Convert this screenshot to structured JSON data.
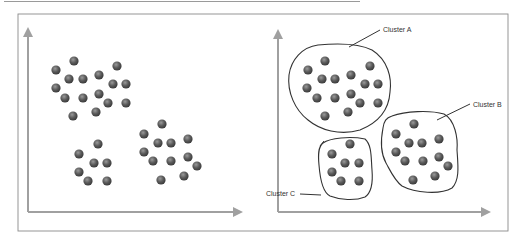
{
  "figure": {
    "colors": {
      "background": "#ffffff",
      "frame": "#8a8a8a",
      "top_rule": "#9a9a9a",
      "axis": "#a0a0a0",
      "dot": "#5a5a5a",
      "dot_highlight": "#9a9a9a",
      "dot_shadow": "#3a3a3a",
      "outline": "#333333",
      "label": "#333333"
    },
    "frame": {
      "x": 18,
      "y": 14,
      "w": 490,
      "h": 217
    },
    "top_rule": {
      "x1": 4,
      "x2": 360,
      "y": 1.5
    }
  },
  "panels": [
    {
      "id": "unclustered",
      "axes": {
        "origin": [
          28,
          212
        ],
        "y_tip": 28,
        "x_tip": 242
      },
      "groups": [
        {
          "points": [
            [
              74,
              61
            ],
            [
              56,
              70
            ],
            [
              69,
              79
            ],
            [
              83,
              79
            ],
            [
              99,
              75
            ],
            [
              117,
              66
            ],
            [
              113,
              84
            ],
            [
              126,
              84
            ],
            [
              56,
              88
            ],
            [
              65,
              98
            ],
            [
              83,
              98
            ],
            [
              99,
              94
            ],
            [
              108,
              103
            ],
            [
              126,
              103
            ],
            [
              73,
              116
            ],
            [
              96,
              112
            ]
          ]
        },
        {
          "points": [
            [
              98,
              144
            ],
            [
              79,
              154
            ],
            [
              94,
              163
            ],
            [
              107,
              163
            ],
            [
              79,
              172
            ],
            [
              88,
              181
            ],
            [
              107,
              181
            ]
          ]
        },
        {
          "points": [
            [
              162,
              124
            ],
            [
              144,
              134
            ],
            [
              158,
              143
            ],
            [
              171,
              143
            ],
            [
              188,
              139
            ],
            [
              144,
              152
            ],
            [
              153,
              161
            ],
            [
              171,
              161
            ],
            [
              188,
              157
            ],
            [
              197,
              166
            ],
            [
              161,
              180
            ],
            [
              184,
              176
            ]
          ]
        }
      ]
    },
    {
      "id": "clustered",
      "axes": {
        "origin": [
          278,
          212
        ],
        "y_tip": 30,
        "x_tip": 490
      },
      "clusters": [
        {
          "name": "Cluster A",
          "label": "Cluster A",
          "label_pos": [
            383,
            32
          ],
          "leader": [
            [
              349,
              47
            ],
            [
              380,
              30
            ]
          ],
          "outline": "M 318 45 C 340 43, 360 44, 372 50 C 388 60, 392 78, 390 92 C 389 108, 380 122, 360 130 C 340 136, 320 130, 308 120 C 295 110, 287 92, 289 75 C 291 60, 302 47, 318 45 Z",
          "points": [
            [
              325,
              61
            ],
            [
              308,
              70
            ],
            [
              322,
              79
            ],
            [
              335,
              79
            ],
            [
              351,
              75
            ],
            [
              370,
              66
            ],
            [
              365,
              84
            ],
            [
              378,
              84
            ],
            [
              307,
              88
            ],
            [
              317,
              98
            ],
            [
              335,
              98
            ],
            [
              351,
              94
            ],
            [
              360,
              103
            ],
            [
              378,
              103
            ],
            [
              325,
              116
            ],
            [
              348,
              112
            ]
          ]
        },
        {
          "name": "Cluster B",
          "label": "Cluster B",
          "label_pos": [
            473,
            107
          ],
          "leader": [
            [
              437,
              120
            ],
            [
              470,
              104
            ]
          ],
          "outline": "M 392 116 C 405 111, 430 110, 444 114 C 455 120, 458 138, 457 150 C 458 165, 460 180, 452 188 C 440 195, 415 193, 402 186 C 394 180, 390 170, 386 163 C 380 152, 381 138, 383 128 C 384 121, 386 118, 392 116 Z",
          "points": [
            [
              414,
              124
            ],
            [
              396,
              134
            ],
            [
              409,
              143
            ],
            [
              422,
              143
            ],
            [
              439,
              139
            ],
            [
              396,
              152
            ],
            [
              405,
              161
            ],
            [
              423,
              161
            ],
            [
              439,
              157
            ],
            [
              448,
              166
            ],
            [
              413,
              180
            ],
            [
              435,
              176
            ]
          ]
        },
        {
          "name": "Cluster C",
          "label": "Cluster C",
          "label_pos": [
            266,
            196
          ],
          "leader": [
            [
              300,
              194
            ],
            [
              321,
              195
            ]
          ],
          "outline": "M 323 143 C 330 138, 350 136, 365 139 C 372 145, 371 158, 372 170 C 373 182, 371 193, 365 197 C 355 201, 340 200, 330 196 C 322 192, 320 178, 319 165 C 318 155, 318 147, 323 143 Z",
          "tick": "M 320 146 L 324 141",
          "points": [
            [
              350,
              144
            ],
            [
              332,
              154
            ],
            [
              345,
              163
            ],
            [
              359,
              163
            ],
            [
              332,
              172
            ],
            [
              341,
              181
            ],
            [
              359,
              181
            ]
          ]
        }
      ]
    }
  ]
}
